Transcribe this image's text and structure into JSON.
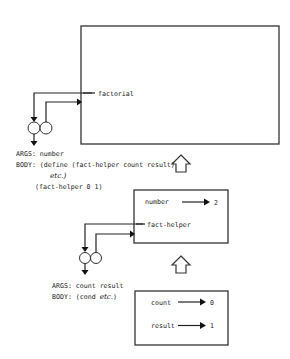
{
  "global_env": {
    "binding_name": "factorial"
  },
  "factorial_procedure": {
    "args_label": "ARGS: number",
    "body_line1": "BODY: (define (fact-helper count result)",
    "body_line2_italic": "etc.)",
    "body_line3": "(fact-helper 0 1)"
  },
  "frame1": {
    "bindings": [
      {
        "name": "number",
        "value": "2"
      },
      {
        "name": "fact-helper",
        "value": ""
      }
    ]
  },
  "fact_helper_procedure": {
    "args_label": "ARGS: count result",
    "body_prefix": "BODY: (cond ",
    "body_italic": "etc.",
    "body_suffix": ")"
  },
  "frame2": {
    "bindings": [
      {
        "name": "count",
        "value": "0"
      },
      {
        "name": "result",
        "value": "1"
      }
    ]
  }
}
